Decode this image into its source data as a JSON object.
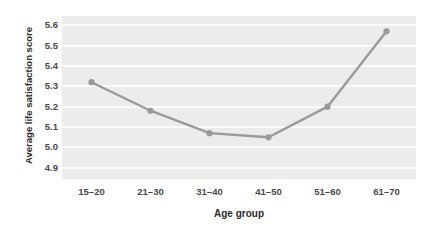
{
  "chart_data": {
    "type": "line",
    "title": "",
    "xlabel": "Age group",
    "ylabel": "Average life satisfaction score",
    "categories": [
      "15–20",
      "21–30",
      "31–40",
      "41–50",
      "51–60",
      "61–70"
    ],
    "values": [
      5.32,
      5.18,
      5.07,
      5.05,
      5.2,
      5.57
    ],
    "series": [
      {
        "name": "Average life satisfaction score",
        "values": [
          5.32,
          5.18,
          5.07,
          5.05,
          5.2,
          5.57
        ]
      }
    ],
    "ytick_labels": [
      "5.6",
      "5.5",
      "5.4",
      "5.3",
      "5.2",
      "5.1",
      "5.0",
      "4.9"
    ],
    "ytick_values": [
      5.6,
      5.5,
      5.4,
      5.3,
      5.2,
      5.1,
      5.0,
      4.9
    ],
    "ylim": [
      4.845,
      5.645
    ],
    "xlim": [
      0,
      6
    ],
    "grid": "horizontal",
    "legend": "none",
    "colors": {
      "line": "#9a9a9a",
      "marker": "#9a9a9a",
      "plot_background": "#ececec",
      "gridline": "#fbfbfb",
      "figure_background": "#ffffff",
      "tick_label": "#4a4a4a",
      "axis_title": "#2b2b2b"
    }
  }
}
